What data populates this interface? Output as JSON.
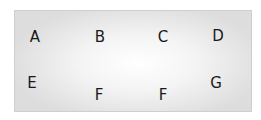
{
  "labels": [
    {
      "text": "A",
      "x": 35,
      "y": 37
    },
    {
      "text": "B",
      "x": 100,
      "y": 37
    },
    {
      "text": "C",
      "x": 163,
      "y": 37
    },
    {
      "text": "D",
      "x": 218,
      "y": 36
    },
    {
      "text": "E",
      "x": 32,
      "y": 83
    },
    {
      "text": "F",
      "x": 99,
      "y": 95
    },
    {
      "text": "F",
      "x": 163,
      "y": 95
    },
    {
      "text": "G",
      "x": 216,
      "y": 83
    }
  ]
}
